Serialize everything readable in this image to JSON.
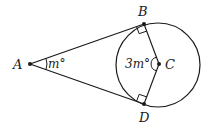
{
  "diagram": {
    "type": "geometry",
    "points": {
      "A": {
        "label": "A"
      },
      "B": {
        "label": "B"
      },
      "C": {
        "label": "C"
      },
      "D": {
        "label": "D"
      }
    },
    "angles": {
      "at_A": "m°",
      "at_C": "3m°"
    },
    "segments": [
      "AB",
      "AD",
      "BC",
      "CD"
    ],
    "right_angles": [
      "ABC",
      "ADC"
    ],
    "colors": {
      "stroke": "#1a1a1a",
      "background": "#ffffff"
    }
  }
}
